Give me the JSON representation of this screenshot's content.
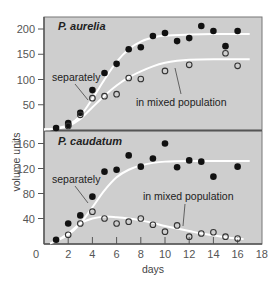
{
  "chart_data": [
    {
      "type": "scatter",
      "title": "P. aurelia",
      "xlabel": "days",
      "ylabel": "volume units",
      "xlim": [
        0,
        18
      ],
      "ylim": [
        0,
        220
      ],
      "xticks": [
        0,
        2,
        4,
        6,
        8,
        10,
        12,
        14,
        16,
        18
      ],
      "yticks": [
        50,
        100,
        150,
        200
      ],
      "grid": false,
      "annotations": [
        "separately",
        "in mixed population"
      ],
      "series": [
        {
          "name": "separately",
          "marker": "filled-circle",
          "points": [
            [
              1,
              4
            ],
            [
              2,
              14
            ],
            [
              2,
              10
            ],
            [
              3,
              34
            ],
            [
              4,
              79
            ],
            [
              5,
              113
            ],
            [
              6,
              131
            ],
            [
              7,
              160
            ],
            [
              8,
              164
            ],
            [
              9,
              186
            ],
            [
              10,
              192
            ],
            [
              11,
              176
            ],
            [
              12,
              182
            ],
            [
              13,
              206
            ],
            [
              14,
              196
            ],
            [
              15,
              166
            ],
            [
              16,
              196
            ]
          ],
          "fit_curve": [
            [
              0,
              1
            ],
            [
              1,
              3
            ],
            [
              2,
              10
            ],
            [
              3,
              28
            ],
            [
              4,
              62
            ],
            [
              5,
              100
            ],
            [
              6,
              135
            ],
            [
              7,
              160
            ],
            [
              8,
              175
            ],
            [
              9,
              183
            ],
            [
              10,
              187
            ],
            [
              12,
              189
            ],
            [
              14,
              190
            ],
            [
              17,
              190
            ]
          ]
        },
        {
          "name": "in mixed population",
          "marker": "open-circle",
          "points": [
            [
              2,
              8
            ],
            [
              3,
              30
            ],
            [
              4,
              63
            ],
            [
              5,
              67
            ],
            [
              6,
              71
            ],
            [
              7,
              103
            ],
            [
              8,
              101
            ],
            [
              10,
              117
            ],
            [
              12,
              129
            ],
            [
              15,
              152
            ],
            [
              16,
              127
            ]
          ],
          "fit_curve": [
            [
              0,
              1
            ],
            [
              1,
              3
            ],
            [
              2,
              8
            ],
            [
              3,
              22
            ],
            [
              4,
              45
            ],
            [
              5,
              68
            ],
            [
              6,
              88
            ],
            [
              7,
              104
            ],
            [
              8,
              116
            ],
            [
              9,
              126
            ],
            [
              10,
              133
            ],
            [
              11,
              137
            ],
            [
              12,
              139
            ],
            [
              14,
              140
            ],
            [
              17,
              140
            ]
          ]
        }
      ]
    },
    {
      "type": "scatter",
      "title": "P. caudatum",
      "xlabel": "days",
      "ylabel": "volume units",
      "xlim": [
        0,
        18
      ],
      "ylim": [
        0,
        180
      ],
      "xticks": [
        0,
        2,
        4,
        6,
        8,
        10,
        12,
        14,
        16,
        18
      ],
      "yticks": [
        40,
        80,
        120,
        160
      ],
      "grid": false,
      "annotations": [
        "separately",
        "in mixed population"
      ],
      "series": [
        {
          "name": "separately",
          "marker": "filled-circle",
          "points": [
            [
              1,
              6
            ],
            [
              2,
              32
            ],
            [
              3,
              45
            ],
            [
              4,
              75
            ],
            [
              5,
              115
            ],
            [
              6,
              118
            ],
            [
              7,
              141
            ],
            [
              8,
              123
            ],
            [
              9,
              136
            ],
            [
              10,
              160
            ],
            [
              11,
              122
            ],
            [
              12,
              133
            ],
            [
              13,
              131
            ],
            [
              14,
              107
            ],
            [
              16,
              123
            ]
          ],
          "fit_curve": [
            [
              0.5,
              0
            ],
            [
              1,
              4
            ],
            [
              2,
              14
            ],
            [
              3,
              32
            ],
            [
              4,
              58
            ],
            [
              5,
              85
            ],
            [
              6,
              106
            ],
            [
              7,
              118
            ],
            [
              8,
              125
            ],
            [
              9,
              129
            ],
            [
              10,
              131
            ],
            [
              12,
              132
            ],
            [
              14,
              132
            ],
            [
              17,
              132
            ]
          ]
        },
        {
          "name": "in mixed population",
          "marker": "open-circle",
          "points": [
            [
              2,
              14
            ],
            [
              3,
              32
            ],
            [
              4,
              51
            ],
            [
              5,
              40
            ],
            [
              6,
              32
            ],
            [
              7,
              35
            ],
            [
              8,
              40
            ],
            [
              9,
              30
            ],
            [
              10,
              19
            ],
            [
              11,
              29
            ],
            [
              12,
              11
            ],
            [
              13,
              16
            ],
            [
              14,
              18
            ],
            [
              15,
              11
            ],
            [
              16,
              8
            ]
          ],
          "fit_curve": [
            [
              1,
              4
            ],
            [
              2,
              16
            ],
            [
              3,
              32
            ],
            [
              4,
              40
            ],
            [
              5,
              43
            ],
            [
              6,
              42
            ],
            [
              7,
              40
            ],
            [
              8,
              37
            ],
            [
              9,
              33
            ],
            [
              10,
              28
            ],
            [
              11,
              24
            ],
            [
              12,
              20
            ],
            [
              13,
              16
            ],
            [
              14,
              13
            ],
            [
              15,
              10
            ],
            [
              16,
              8
            ],
            [
              16.5,
              7
            ]
          ]
        }
      ]
    }
  ],
  "labels": {
    "top_title": "P. aurelia",
    "bottom_title": "P. caudatum",
    "top_separately": "separately",
    "top_mixed": "in mixed population",
    "bottom_separately": "separately",
    "bottom_mixed": "in mixed population",
    "ylabel": "volume units",
    "xlabel": "days",
    "x_zero": "0"
  },
  "colors": {
    "panel_bg": "#cecece",
    "curve": "#ffffff",
    "marker": "#111111",
    "axis": "#555555"
  }
}
